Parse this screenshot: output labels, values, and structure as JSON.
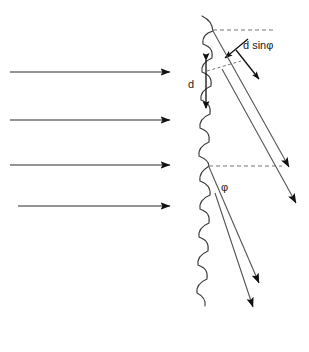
{
  "diagram": {
    "background_color": "#ffffff",
    "line_color": "#2b2b2b",
    "ray_color": "#555555",
    "dashed_color": "#777777",
    "labels": {
      "path_difference": "d sinφ",
      "spacing": "d",
      "angle": "φ"
    },
    "incident_rays": [
      {
        "name": "incident-ray-1",
        "x1": 10,
        "y1": 72,
        "x2": 172,
        "y2": 72
      },
      {
        "name": "incident-ray-2",
        "x1": 10,
        "y1": 120,
        "x2": 172,
        "y2": 120
      },
      {
        "name": "incident-ray-3",
        "x1": 10,
        "y1": 165,
        "x2": 172,
        "y2": 165
      },
      {
        "name": "incident-ray-4",
        "x1": 18,
        "y1": 206,
        "x2": 172,
        "y2": 206
      }
    ],
    "diffracted_rays": [
      {
        "name": "diffracted-ray-1",
        "x1": 213,
        "y1": 31,
        "x2": 292,
        "y2": 172
      },
      {
        "name": "diffracted-ray-2",
        "x1": 222,
        "y1": 68,
        "x2": 299,
        "y2": 208
      },
      {
        "name": "diffracted-ray-3",
        "x1": 209,
        "y1": 166,
        "x2": 262,
        "y2": 288
      },
      {
        "name": "diffracted-ray-4",
        "x1": 215,
        "y1": 192,
        "x2": 256,
        "y2": 312
      }
    ],
    "short_arrows": [
      {
        "name": "path-difference-arrow-upper",
        "x1": 248,
        "y1": 40,
        "x2": 224,
        "y2": 60
      },
      {
        "name": "path-difference-arrow-lower",
        "x1": 237,
        "y1": 52,
        "x2": 260,
        "y2": 80
      }
    ],
    "dashed_guides": [
      {
        "name": "dashed-normal-top",
        "x1": 213,
        "y1": 30,
        "x2": 276,
        "y2": 30
      },
      {
        "name": "dashed-path-segment",
        "x1": 209,
        "y1": 70,
        "x2": 240,
        "y2": 62
      },
      {
        "name": "dashed-angle-baseline",
        "x1": 209,
        "y1": 166,
        "x2": 282,
        "y2": 166
      }
    ],
    "spacing_measure": {
      "name": "spacing-measure",
      "x": 206,
      "y_top": 58,
      "y_bottom": 110
    },
    "crystal_surface": {
      "name": "crystal-surface",
      "description": "scalloped vertical line of repeating curved atomic-plane segments",
      "x_center": 205,
      "y_start": 16,
      "y_end": 306,
      "segment_count": 11
    }
  }
}
